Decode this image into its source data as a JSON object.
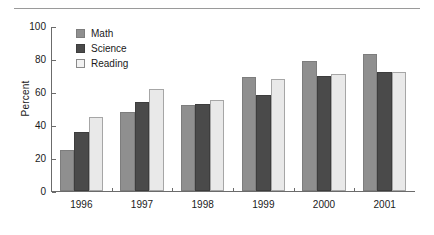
{
  "chart_data": {
    "type": "bar",
    "title": "",
    "xlabel": "",
    "ylabel": "Percent",
    "categories": [
      "1996",
      "1997",
      "1998",
      "1999",
      "2000",
      "2001"
    ],
    "series": [
      {
        "name": "Math",
        "color": "#8f8f8f",
        "values": [
          25,
          48,
          52,
          69,
          79,
          83
        ]
      },
      {
        "name": "Science",
        "color": "#4a4a4a",
        "values": [
          36,
          54,
          53,
          58,
          70,
          72
        ]
      },
      {
        "name": "Reading",
        "color": "#e9e9e9",
        "values": [
          45,
          62,
          55,
          68,
          71,
          72
        ]
      }
    ],
    "ylim": [
      0,
      100
    ],
    "ytick_labels": [
      "0",
      "20",
      "40",
      "60",
      "80",
      "100"
    ],
    "ytick_values": [
      0,
      20,
      40,
      60,
      80,
      100
    ],
    "grid": false,
    "legend_position": "top-left-inside"
  },
  "legend": {
    "items": [
      {
        "label": "Math",
        "swatch": "math-swatch"
      },
      {
        "label": "Science",
        "swatch": "science-swatch"
      },
      {
        "label": "Reading",
        "swatch": "reading-swatch"
      }
    ]
  },
  "decoration": {
    "top_rule_color": "#9a9a9a",
    "axis_color": "#6b6b6b",
    "background": "#ffffff"
  }
}
